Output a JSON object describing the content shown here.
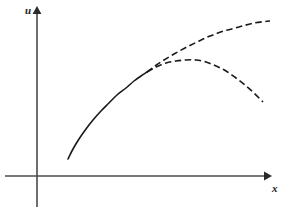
{
  "figure": {
    "name": "bifurcation-curve-diagram",
    "background_color": "#ffffff",
    "ink_color": "#1a1a1a",
    "axes": {
      "x_axis_label": "x",
      "y_axis_label": "u",
      "x_axis_arrow": "arrow-right",
      "y_axis_arrow": "arrow-up",
      "origin_px": [
        37,
        176
      ],
      "x_axis_start_px": [
        5,
        176
      ],
      "x_axis_end_px": [
        268,
        176
      ],
      "y_axis_top_px": [
        37,
        8
      ],
      "y_axis_bottom_px": [
        37,
        207
      ],
      "ticks": [],
      "tick_labels": [],
      "grid": false
    },
    "legend": null,
    "annotations": []
  },
  "chart_data": {
    "type": "line",
    "title": "",
    "subtitle": "",
    "xlabel": "x",
    "ylabel": "u",
    "xlim": [
      0,
      292
    ],
    "ylim": [
      0,
      220
    ],
    "grid": false,
    "legend_position": "none",
    "coordinate_space": "pixels",
    "axis_origin": [
      37,
      176
    ],
    "branch_point": [
      147,
      72
    ],
    "series": [
      {
        "name": "primary-solid-branch",
        "style": "solid",
        "linewidth": 1.6,
        "color": "#1a1a1a",
        "points": [
          [
            68,
            159
          ],
          [
            73,
            149
          ],
          [
            79,
            139
          ],
          [
            86,
            129
          ],
          [
            93,
            120
          ],
          [
            101,
            111
          ],
          [
            109,
            103
          ],
          [
            117,
            95
          ],
          [
            126,
            88
          ],
          [
            134,
            81
          ],
          [
            141,
            76
          ],
          [
            147,
            72
          ]
        ]
      },
      {
        "name": "upper-dashed-branch",
        "style": "dashed",
        "dash_pattern": [
          6.5,
          3.5
        ],
        "linewidth": 1.6,
        "color": "#1a1a1a",
        "points": [
          [
            147,
            72
          ],
          [
            155,
            66
          ],
          [
            164,
            60
          ],
          [
            174,
            54
          ],
          [
            185,
            48
          ],
          [
            197,
            42
          ],
          [
            210,
            36
          ],
          [
            224,
            31
          ],
          [
            239,
            27
          ],
          [
            254,
            23
          ],
          [
            270,
            21
          ]
        ]
      },
      {
        "name": "lower-dashed-branch",
        "style": "dashed",
        "dash_pattern": [
          6.5,
          3.5
        ],
        "linewidth": 1.6,
        "color": "#1a1a1a",
        "points": [
          [
            147,
            72
          ],
          [
            156,
            67
          ],
          [
            166,
            63
          ],
          [
            176,
            61
          ],
          [
            186,
            60
          ],
          [
            196,
            60
          ],
          [
            206,
            62
          ],
          [
            216,
            66
          ],
          [
            226,
            71
          ],
          [
            236,
            78
          ],
          [
            245,
            85
          ],
          [
            254,
            93
          ],
          [
            263,
            102
          ]
        ]
      }
    ]
  }
}
